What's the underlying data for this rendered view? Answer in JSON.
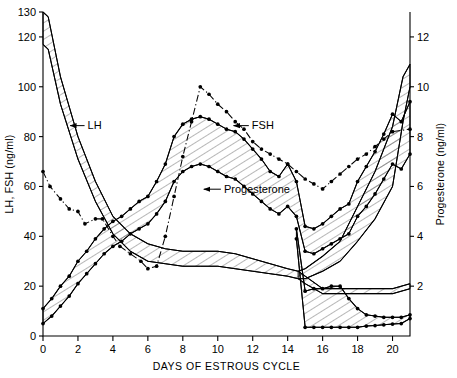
{
  "figure": {
    "xtitle": "DAYS OF ESTROUS CYCLE",
    "ytitle_left": "LH, FSH (ng/ml)",
    "ytitle_right": "Progesterone (ng/ml)",
    "label_lh": "LH",
    "label_fsh": "FSH",
    "label_progesterone": "Progesterone"
  },
  "chart_data": {
    "type": "line",
    "title": "",
    "xlabel": "DAYS OF ESTROUS CYCLE",
    "ylabel": "LH, FSH (ng/ml)",
    "ylabel_right": "Progesterone (ng/ml)",
    "xlim": [
      0,
      21
    ],
    "ylim": [
      0,
      130
    ],
    "ylim_right": [
      0,
      13
    ],
    "xticks": [
      0,
      2,
      4,
      6,
      8,
      10,
      12,
      14,
      16,
      18,
      20
    ],
    "xticklabels": [
      "0",
      "2",
      "4",
      "6",
      "8",
      "10",
      "12",
      "14",
      "16",
      "18",
      "20"
    ],
    "yticks": [
      0,
      20,
      40,
      60,
      80,
      100,
      120,
      130
    ],
    "yticklabels": [
      "0",
      "20",
      "40",
      "60",
      "80",
      "100",
      "120",
      "130"
    ],
    "yticks_right": [
      2,
      4,
      6,
      8,
      10,
      12
    ],
    "yticklabels_right": [
      "2",
      "4",
      "6",
      "8",
      "10",
      "12"
    ],
    "grid": false,
    "legend_position": "inline-annotations",
    "annotations": [
      {
        "text": "LH",
        "x": 2.55,
        "y": 83,
        "arrow_to_x": 1.55,
        "arrow_to_y": 83
      },
      {
        "text": "FSH",
        "x": 11.95,
        "y": 83,
        "arrow_to_x": 10.9,
        "arrow_to_y": 83
      },
      {
        "text": "Progesterone",
        "x": 10.35,
        "y": 57.5,
        "arrow_to_x": 9.2,
        "arrow_to_y": 57.5
      }
    ],
    "series": [
      {
        "name": "LH upper (band top)",
        "axis": "left",
        "style": "hatched-band-edge",
        "x": [
          0,
          0.3,
          1,
          2,
          3,
          4,
          5,
          6,
          7,
          8,
          9,
          10,
          11,
          12,
          13,
          14,
          14.6,
          15,
          16,
          17,
          18,
          19,
          20,
          21
        ],
        "y": [
          130,
          128,
          104,
          80,
          62,
          48,
          41,
          37,
          35,
          34,
          34,
          34,
          33,
          31,
          29,
          27,
          26,
          24,
          19,
          19,
          19,
          19,
          19,
          21
        ]
      },
      {
        "name": "LH lower (band bottom)",
        "axis": "left",
        "style": "hatched-band-edge",
        "x": [
          0,
          0.3,
          1,
          2,
          3,
          4,
          5,
          6,
          7,
          8,
          9,
          10,
          11,
          12,
          13,
          14,
          14.6,
          15,
          16,
          17,
          18,
          19,
          20,
          21
        ],
        "y": [
          117,
          115,
          93,
          71,
          54,
          41,
          34,
          30,
          29,
          28,
          28,
          28,
          27,
          26,
          25,
          24,
          23,
          21,
          17,
          17,
          17,
          17,
          17,
          19
        ]
      },
      {
        "name": "LH preovulatory surge upper",
        "axis": "left",
        "style": "hatched-band-edge",
        "x": [
          14.6,
          15,
          16,
          17,
          18,
          19,
          20,
          20.6,
          21
        ],
        "y": [
          26,
          27,
          32,
          38,
          52,
          66,
          84,
          104,
          109
        ]
      },
      {
        "name": "LH preovulatory surge lower",
        "axis": "left",
        "style": "hatched-band-edge",
        "x": [
          14.6,
          15,
          16,
          17,
          18,
          19,
          20,
          20.6,
          21
        ],
        "y": [
          23,
          23,
          26,
          30,
          38,
          47,
          60,
          86,
          100
        ]
      },
      {
        "name": "FSH",
        "axis": "left",
        "style": "dash-dot-with-markers",
        "x": [
          0,
          0.4,
          1,
          1.5,
          2,
          2.4,
          3,
          3.4,
          4,
          4.4,
          5,
          5.6,
          6,
          6.5,
          7,
          7.5,
          8,
          8.5,
          9,
          9.5,
          10,
          10.5,
          11,
          11.5,
          12,
          12.5,
          13,
          13.5,
          14,
          14.5,
          15,
          15.5,
          16,
          16.5,
          17,
          17.5,
          18,
          18.5,
          19,
          19.5,
          20,
          21
        ],
        "y": [
          66,
          60,
          55,
          51,
          50,
          45,
          47,
          47,
          40,
          36,
          33,
          30,
          27,
          28,
          40,
          56,
          72,
          86,
          100,
          97,
          93,
          90,
          86,
          83,
          78,
          75,
          73,
          71,
          69,
          66,
          63,
          61,
          59,
          62,
          65,
          68,
          71,
          73,
          76,
          79,
          82,
          83
        ]
      },
      {
        "name": "Progesterone upper (band top)",
        "axis": "right",
        "style": "hatched-band-edge",
        "x": [
          0,
          0.5,
          1,
          1.5,
          2,
          2.5,
          3,
          3.5,
          4,
          4.5,
          5,
          5.5,
          6,
          6.5,
          7,
          7.5,
          8,
          8.5,
          9,
          9.5,
          10,
          10.5,
          11,
          11.5,
          12,
          12.5,
          13,
          13.5,
          14,
          14.5,
          15,
          15.5,
          16,
          16.5,
          17,
          17.5,
          18,
          18.5,
          19,
          19.5,
          20,
          20.5,
          21
        ],
        "y": [
          1.1,
          1.5,
          2.0,
          2.4,
          3.0,
          3.4,
          3.9,
          4.3,
          4.6,
          4.8,
          5.1,
          5.4,
          5.6,
          6.2,
          6.9,
          8.0,
          8.5,
          8.7,
          8.8,
          8.7,
          8.5,
          8.3,
          8.2,
          7.9,
          7.5,
          7.1,
          6.6,
          6.4,
          6.9,
          6.2,
          4.4,
          4.3,
          4.5,
          4.8,
          5.1,
          5.3,
          6.2,
          6.8,
          7.4,
          8.1,
          8.9,
          8.6,
          9.4
        ]
      },
      {
        "name": "Progesterone lower (band bottom)",
        "axis": "right",
        "style": "hatched-band-edge",
        "x": [
          0,
          0.5,
          1,
          1.5,
          2,
          2.5,
          3,
          3.5,
          4,
          4.5,
          5,
          5.5,
          6,
          6.5,
          7,
          7.5,
          8,
          8.5,
          9,
          9.5,
          10,
          10.5,
          11,
          11.5,
          12,
          12.5,
          13,
          13.5,
          14,
          14.5,
          15,
          15.5,
          16,
          16.5,
          17,
          17.5,
          18,
          18.5,
          19,
          19.5,
          20,
          20.5,
          21
        ],
        "y": [
          0.5,
          0.8,
          1.2,
          1.6,
          2.1,
          2.5,
          2.9,
          3.3,
          3.6,
          3.8,
          4.1,
          4.3,
          4.5,
          4.9,
          5.4,
          6.2,
          6.6,
          6.8,
          6.9,
          6.8,
          6.6,
          6.4,
          6.3,
          6.0,
          5.7,
          5.4,
          5.1,
          4.9,
          5.2,
          4.8,
          3.4,
          3.3,
          3.5,
          3.7,
          3.9,
          4.1,
          4.8,
          5.2,
          5.7,
          6.3,
          6.9,
          6.7,
          7.3
        ]
      },
      {
        "name": "Progesterone luteolysis tail upper",
        "axis": "right",
        "style": "hatched-band-edge",
        "x": [
          14.5,
          15,
          15.5,
          16,
          16.5,
          17,
          17.5,
          18,
          18.5,
          19,
          19.5,
          20,
          20.5,
          21
        ],
        "y": [
          4.3,
          1.8,
          1.9,
          1.9,
          2.0,
          2.0,
          1.5,
          1.1,
          0.85,
          0.8,
          0.75,
          0.75,
          0.75,
          0.85
        ]
      },
      {
        "name": "Progesterone luteolysis tail lower",
        "axis": "right",
        "style": "hatched-band-edge",
        "x": [
          14.5,
          15,
          15.5,
          16,
          16.5,
          17,
          17.5,
          18,
          18.5,
          19,
          19.5,
          20,
          20.5,
          21
        ],
        "y": [
          3.9,
          0.35,
          0.35,
          0.35,
          0.35,
          0.35,
          0.35,
          0.35,
          0.4,
          0.42,
          0.45,
          0.48,
          0.5,
          0.7
        ]
      }
    ]
  }
}
